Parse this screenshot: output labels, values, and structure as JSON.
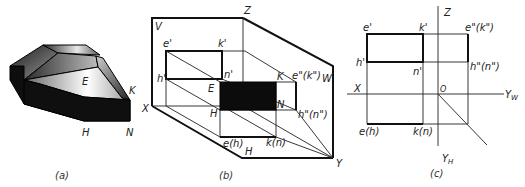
{
  "figure": {
    "panels": [
      {
        "id": "a",
        "caption": "(a)",
        "description": "Shaded solid (truncated polyhedron) with a rectangular notch",
        "labels": {
          "E": "E",
          "K": "K",
          "H": "H",
          "N": "N"
        }
      },
      {
        "id": "b",
        "caption": "(b)",
        "description": "Three-plane projection system pictorial",
        "labels": {
          "V": "V",
          "Z": "Z",
          "W": "W",
          "X": "X",
          "H_plane": "H",
          "Y": "Y",
          "e1": "e'",
          "k1": "k'",
          "h1": "h'",
          "n1": "n'",
          "E": "E",
          "K": "K",
          "H": "H",
          "N": "N",
          "ek2": "e\"(k\")",
          "hn2": "h\"(n\")",
          "eh": "e(h)",
          "kn": "k(n)"
        }
      },
      {
        "id": "c",
        "caption": "(c)",
        "description": "Orthographic projections (three views)",
        "labels": {
          "Z": "Z",
          "X": "X",
          "O": "O",
          "Yw": "Y",
          "Yw_sub": "W",
          "Yh": "Y",
          "Yh_sub": "H",
          "e1": "e'",
          "k1": "k'",
          "h1": "h'",
          "n1": "n'",
          "ek2": "e\"(k\")",
          "hn2": "h\"(n\")",
          "eh": "e(h)",
          "kn": "k(n)"
        }
      }
    ]
  }
}
